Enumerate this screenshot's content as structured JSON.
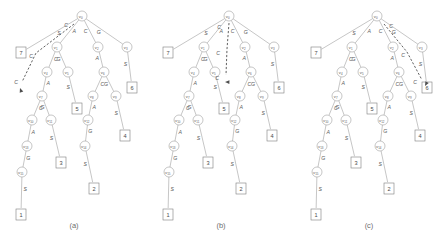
{
  "figure": {
    "type": "suffix-tree-traversal-diagram",
    "panel_count": 3
  },
  "panels": [
    {
      "id": "a",
      "caption": "(a)",
      "arrow_label": "C",
      "arrow_target": "left-subtree"
    },
    {
      "id": "b",
      "caption": "(b)",
      "arrow_label": "C",
      "arrow_target": "middle-subtree"
    },
    {
      "id": "c",
      "caption": "(c)",
      "arrow_label": "C",
      "arrow_target": "right-subtree"
    }
  ],
  "tree": {
    "root": {
      "label": "v",
      "sub": "0"
    },
    "nodes": [
      {
        "id": "v0",
        "label": "v",
        "sub": "0",
        "x": 82,
        "y": 16
      },
      {
        "id": "v1",
        "label": "v",
        "sub": "1",
        "x": 57,
        "y": 47
      },
      {
        "id": "v2",
        "label": "v",
        "sub": "2",
        "x": 98,
        "y": 47
      },
      {
        "id": "v3",
        "label": "v",
        "sub": "3",
        "x": 127,
        "y": 47
      },
      {
        "id": "v4",
        "label": "v",
        "sub": "4",
        "x": 47,
        "y": 72
      },
      {
        "id": "v5",
        "label": "v",
        "sub": "5",
        "x": 68,
        "y": 72
      },
      {
        "id": "v6",
        "label": "v",
        "sub": "6",
        "x": 104,
        "y": 72
      },
      {
        "id": "v7",
        "label": "v",
        "sub": "7",
        "x": 42,
        "y": 96
      },
      {
        "id": "v8",
        "label": "v",
        "sub": "8",
        "x": 93,
        "y": 96
      },
      {
        "id": "v9",
        "label": "v",
        "sub": "9",
        "x": 116,
        "y": 96
      },
      {
        "id": "v10",
        "label": "v",
        "sub": "10",
        "x": 32,
        "y": 120
      },
      {
        "id": "v11",
        "label": "v",
        "sub": "11",
        "x": 51,
        "y": 120
      },
      {
        "id": "v12",
        "label": "v",
        "sub": "12",
        "x": 88,
        "y": 120
      },
      {
        "id": "v13",
        "label": "v",
        "sub": "13",
        "x": 27,
        "y": 146
      },
      {
        "id": "v14",
        "label": "v",
        "sub": "14",
        "x": 85,
        "y": 146
      },
      {
        "id": "v15",
        "label": "v",
        "sub": "15",
        "x": 22,
        "y": 172
      }
    ],
    "edges": [
      {
        "from": "v0",
        "to": "leaf7",
        "label": "S"
      },
      {
        "from": "v0",
        "to": "v1",
        "label": "A"
      },
      {
        "from": "v0",
        "to": "v2",
        "label": "C"
      },
      {
        "from": "v0",
        "to": "v3",
        "label": "G"
      },
      {
        "from": "v1",
        "to": "v4",
        "label": "C"
      },
      {
        "from": "v1",
        "to": "v5",
        "label": "G"
      },
      {
        "from": "v2",
        "to": "v6",
        "label": "A"
      },
      {
        "from": "v3",
        "to": "leaf6",
        "label": "S"
      },
      {
        "from": "v4",
        "to": "v7",
        "label": "A"
      },
      {
        "from": "v5",
        "to": "leaf5",
        "label": "S"
      },
      {
        "from": "v6",
        "to": "v8",
        "label": "C"
      },
      {
        "from": "v6",
        "to": "v9",
        "label": "G"
      },
      {
        "from": "v7",
        "to": "v10",
        "label": "C"
      },
      {
        "from": "v7",
        "to": "v11",
        "label": "G"
      },
      {
        "from": "v8",
        "to": "v12",
        "label": "A"
      },
      {
        "from": "v9",
        "to": "leaf4",
        "label": "S"
      },
      {
        "from": "v10",
        "to": "v13",
        "label": "A"
      },
      {
        "from": "v11",
        "to": "leaf3",
        "label": "S"
      },
      {
        "from": "v12",
        "to": "v14",
        "label": "G"
      },
      {
        "from": "v13",
        "to": "v15",
        "label": "G"
      },
      {
        "from": "v14",
        "to": "leaf2",
        "label": "S"
      },
      {
        "from": "v15",
        "to": "leaf1",
        "label": "S"
      }
    ],
    "leaves": [
      {
        "id": "leaf7",
        "text": "7",
        "x": 16,
        "y": 47
      },
      {
        "id": "leaf6",
        "text": "6",
        "x": 127,
        "y": 82
      },
      {
        "id": "leaf5",
        "text": "5",
        "x": 72,
        "y": 103
      },
      {
        "id": "leaf4",
        "text": "4",
        "x": 120,
        "y": 130
      },
      {
        "id": "leaf3",
        "text": "3",
        "x": 56,
        "y": 157
      },
      {
        "id": "leaf2",
        "text": "2",
        "x": 89,
        "y": 183
      },
      {
        "id": "leaf1",
        "text": "1",
        "x": 16,
        "y": 209
      }
    ]
  },
  "annotations": {
    "a": {
      "labels": [
        {
          "text": "C",
          "x": 66,
          "y": 27
        },
        {
          "text": "C",
          "x": 31,
          "y": 58
        },
        {
          "text": "C",
          "x": 16,
          "y": 84
        }
      ],
      "path": "M 74 24 L 36 53 L 22 82",
      "arrow": {
        "x": 20,
        "y": 88,
        "angle": 250
      }
    },
    "b": {
      "labels": [
        {
          "text": "C",
          "x": 72,
          "y": 29
        },
        {
          "text": "C",
          "x": 71,
          "y": 55
        },
        {
          "text": "C",
          "x": 70,
          "y": 80
        }
      ],
      "path": "M 82 23 L 80 49 L 79 75",
      "arrow": {
        "x": 78,
        "y": 82,
        "angle": 182
      }
    },
    "c": {
      "labels": [
        {
          "text": "C",
          "x": 96,
          "y": 28
        },
        {
          "text": "C",
          "x": 108,
          "y": 57
        },
        {
          "text": "C",
          "x": 120,
          "y": 84
        }
      ],
      "path": "M 89 24 L 112 52 L 127 80",
      "arrow": {
        "x": 130,
        "y": 86,
        "angle": 118
      }
    }
  }
}
